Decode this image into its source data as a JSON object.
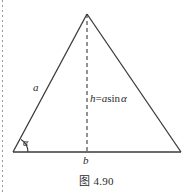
{
  "figure": {
    "caption": "图 4.90",
    "labels": {
      "side_a": "a",
      "base_b": "b",
      "angle_alpha": "α",
      "height_formula_lhs": "h",
      "height_formula_eq": "=",
      "height_formula_a": "a",
      "height_formula_sin": "sin",
      "height_formula_alpha": "α"
    },
    "colors": {
      "line": "#3a3a3a",
      "text": "#2b2b2b",
      "background": "#ffffff",
      "margin_dots": "#9a9a9a"
    },
    "geometry": {
      "apex": [
        87,
        14
      ],
      "left_vertex": [
        13,
        152
      ],
      "right_vertex": [
        181,
        152
      ],
      "foot_of_altitude": [
        87,
        152
      ],
      "angle_arc_radius": 15
    }
  }
}
